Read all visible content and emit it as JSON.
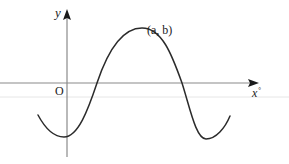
{
  "diagram": {
    "type": "sine-like curve on coordinate axes",
    "labels": {
      "y_axis": "y",
      "origin": "O",
      "max_point": "(a, b)",
      "x_axis": "x",
      "x_axis_unit": "°"
    },
    "colors": {
      "curve": "#2b2b2b",
      "axes": "#8a8a8a",
      "arrowheads": "#1a1a1a",
      "background": "#ffffff",
      "artifact_line": "#e4e4e4"
    },
    "features": [
      "y-axis with upward arrow",
      "x-axis with rightward arrow",
      "curve starting below x-axis, minimum just right of y-axis",
      "curve crosses x-axis, reaches maximum labelled (a, b)",
      "curve crosses x-axis again, reaches second minimum, rises"
    ]
  }
}
